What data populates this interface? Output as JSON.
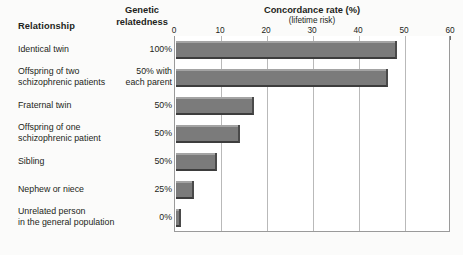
{
  "headers": {
    "relationship": "Relationship",
    "genetic_relatedness": "Genetic\nrelatedness",
    "concordance_title": "Concordance rate (%)",
    "concordance_subtitle": "(lifetime risk)"
  },
  "chart_data": {
    "type": "bar",
    "orientation": "horizontal",
    "title": "Concordance rate (%)",
    "subtitle": "(lifetime risk)",
    "xlabel": "Concordance rate (%)",
    "ylabel": "Relationship",
    "xlim": [
      0,
      60
    ],
    "xticks": [
      0,
      10,
      20,
      30,
      40,
      50,
      60
    ],
    "xticklabels": [
      "0",
      "10",
      "20",
      "30",
      "40",
      "50",
      "60"
    ],
    "grid": true,
    "legend": "none",
    "bar_color": "#7b7b7b",
    "categories": [
      "Identical twin",
      "Offspring of two\nschizophrenic patients",
      "Fraternal twin",
      "Offspring of one\nschizophrenic patient",
      "Sibling",
      "Nephew or niece",
      "Unrelated person\nin the general population"
    ],
    "genetic_relatedness": [
      "100%",
      "50% with\neach parent",
      "50%",
      "50%",
      "50%",
      "25%",
      "0%"
    ],
    "values": [
      48,
      46,
      17,
      14,
      9,
      4,
      1
    ]
  }
}
